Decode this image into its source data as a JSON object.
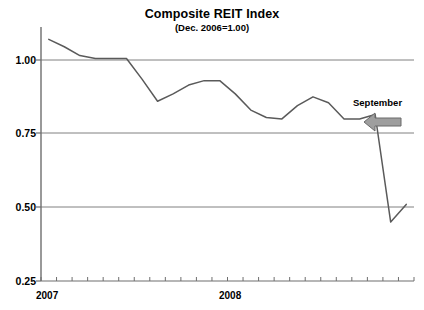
{
  "chart_data": {
    "type": "line",
    "title": "Composite REIT Index",
    "subtitle": "(Dec. 2006=1.00)",
    "xlabel": "",
    "ylabel": "",
    "ylim": [
      0.25,
      1.12
    ],
    "yticks": [
      "0.25",
      "0.50",
      "0.75",
      "1.00"
    ],
    "ytick_values": [
      0.25,
      0.5,
      0.75,
      1.0
    ],
    "grid": true,
    "legend": "none",
    "x_year_labels": [
      "2007",
      "2008"
    ],
    "x_tick_count": 24,
    "x": [
      "2007-01",
      "2007-02",
      "2007-03",
      "2007-04",
      "2007-05",
      "2007-06",
      "2007-07",
      "2007-08",
      "2007-09",
      "2007-10",
      "2007-11",
      "2007-12",
      "2008-01",
      "2008-02",
      "2008-03",
      "2008-04",
      "2008-05",
      "2008-06",
      "2008-07",
      "2008-08",
      "2008-09",
      "2008-10",
      "2008-11",
      "2008-12"
    ],
    "values": [
      1.07,
      1.045,
      1.015,
      1.005,
      1.005,
      1.005,
      0.935,
      0.86,
      0.885,
      0.915,
      0.93,
      0.93,
      0.885,
      0.83,
      0.805,
      0.8,
      0.845,
      0.875,
      0.855,
      0.8,
      0.8,
      0.815,
      0.45,
      0.51
    ],
    "series_color": "#5a5a5a",
    "grid_color": "#808080",
    "axis_color": "#6e6e6e",
    "annotations": [
      {
        "label": "September",
        "arrow": "left-arrow",
        "arrow_color": "#9e9e9e",
        "arrow_outline": "#6b6b6b",
        "target_point": "2008-09"
      }
    ]
  }
}
